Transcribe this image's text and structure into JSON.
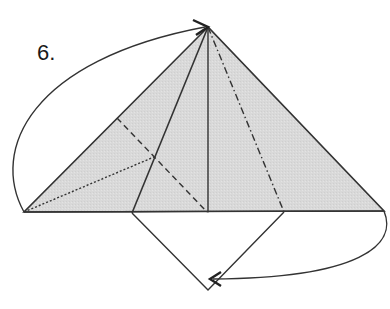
{
  "step": {
    "label": "6."
  },
  "colors": {
    "paper_fill": "#d9d9d9",
    "line": "#333333",
    "background": "#ffffff"
  },
  "diagram": {
    "apex": [
      208,
      27
    ],
    "base_left": [
      24,
      212
    ],
    "base_right": [
      384,
      211
    ],
    "inner_base_points": [
      [
        132,
        213
      ],
      [
        208,
        213
      ],
      [
        284,
        212
      ]
    ],
    "flap_bottom": [
      208,
      290
    ],
    "arrows": [
      {
        "name": "fold-up-arrow",
        "from": [
          24,
          212
        ],
        "to": [
          208,
          27
        ]
      },
      {
        "name": "fold-under-arrow",
        "from": [
          384,
          211
        ],
        "to": [
          212,
          278
        ]
      }
    ]
  },
  "caption": {
    "text": ""
  }
}
